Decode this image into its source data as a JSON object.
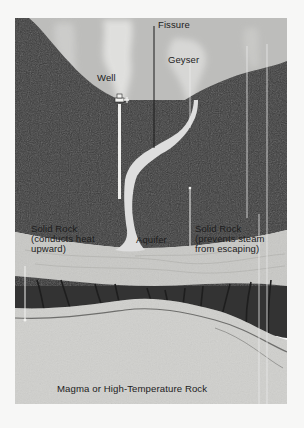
{
  "diagram": {
    "labels": {
      "fissure": "Fissure",
      "geyser": "Geyser",
      "well": "Well",
      "solid_rock_left_line1": "Solid Rock",
      "solid_rock_left_line2": "(conducts heat",
      "solid_rock_left_line3": "upward)",
      "aquifer": "Aquifer",
      "solid_rock_right_line1": "Solid Rock",
      "solid_rock_right_line2": "(prevents steam",
      "solid_rock_right_line3": "from escaping)",
      "magma": "Magma or High-Temperature Rock"
    },
    "colors": {
      "page_background": "#f7f7f6",
      "sky": "#bdbdbb",
      "steam": "#e4e4e2",
      "upper_rock": "#3a3a3a",
      "aquifer_band": "#c9c9c6",
      "lower_rock": "#333333",
      "magma": "#d0d0cd",
      "label_text": "#1c1c1c",
      "leader_lines": "#e8e8e8"
    }
  }
}
